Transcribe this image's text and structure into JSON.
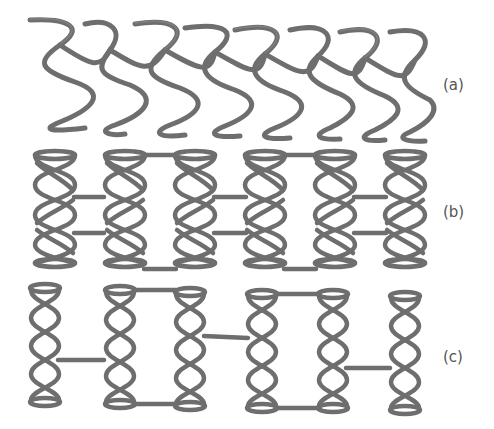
{
  "figure": {
    "panels": [
      {
        "id": "a",
        "label": "(a)",
        "description": "Helical wire stent with crossing sinusoidal struts"
      },
      {
        "id": "b",
        "label": "(b)",
        "description": "Coiled ring segments joined in pairs by horizontal connectors"
      },
      {
        "id": "c",
        "label": "(c)",
        "description": "Helical ring segments joined by alternating single connectors"
      }
    ],
    "colors": {
      "strut": "#6e6e6e",
      "strut_highlight": "#8a8a8a",
      "label": "#555555",
      "background": "#ffffff"
    }
  }
}
